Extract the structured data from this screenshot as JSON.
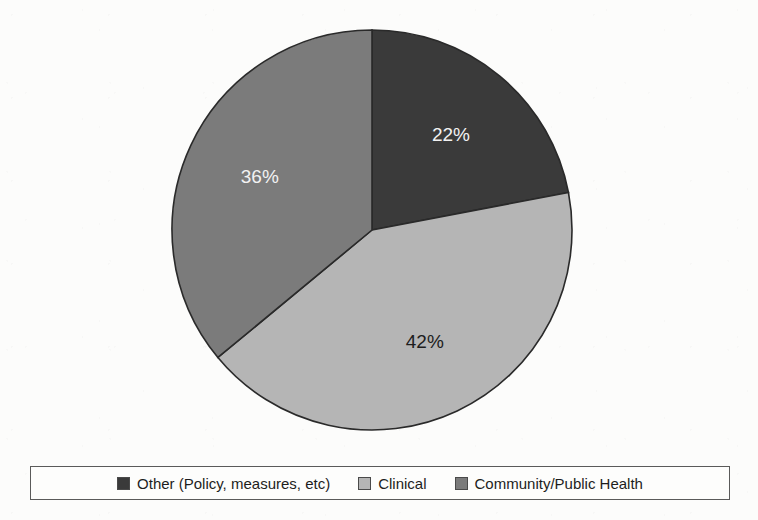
{
  "chart_data": {
    "type": "pie",
    "title": "",
    "subtitle": "",
    "xlabel": "",
    "ylabel": "",
    "grid": false,
    "legend_position": "bottom",
    "start_angle_deg": 0,
    "direction": "clockwise",
    "categories": [
      "Other (Policy, measures, etc)",
      "Clinical",
      "Community/Public Health"
    ],
    "values": [
      22,
      42,
      36
    ],
    "data_labels": [
      "22%",
      "42%",
      "36%"
    ],
    "colors": [
      "#3a3a3a",
      "#b5b5b5",
      "#7b7b7b"
    ],
    "label_colors": [
      "#f2f2f2",
      "#1d1d1d",
      "#f2f2f2"
    ],
    "slices": [
      {
        "name": "Other (Policy, measures, etc)",
        "value": 22,
        "label": "22%",
        "color": "#3a3a3a",
        "label_color": "#f2f2f2"
      },
      {
        "name": "Clinical",
        "value": 42,
        "label": "42%",
        "color": "#b5b5b5",
        "label_color": "#1d1d1d"
      },
      {
        "name": "Community/Public Health",
        "value": 36,
        "label": "36%",
        "color": "#7b7b7b",
        "label_color": "#f2f2f2"
      }
    ]
  },
  "legend": {
    "items": [
      {
        "label": "Other (Policy, measures, etc)",
        "color": "#3a3a3a",
        "swatch_name": "legend-swatch-other"
      },
      {
        "label": "Clinical",
        "color": "#b5b5b5",
        "swatch_name": "legend-swatch-clinical"
      },
      {
        "label": "Community/Public Health",
        "color": "#7b7b7b",
        "swatch_name": "legend-swatch-community"
      }
    ]
  },
  "colors": {
    "background": "#fcfcfb",
    "slice_dark": "#3a3a3a",
    "slice_light": "#b5b5b5",
    "slice_medium": "#7b7b7b",
    "outline": "#2a2a2a",
    "legend_border": "#5a5a5a",
    "text": "#1d1d1d"
  }
}
